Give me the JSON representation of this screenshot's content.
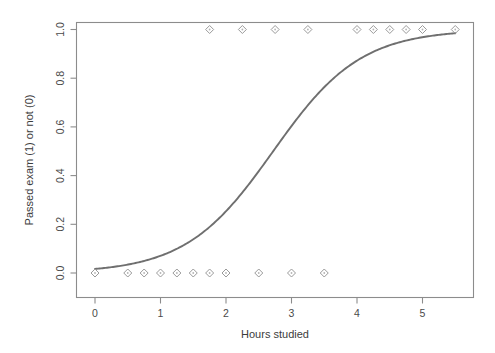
{
  "chart_data": {
    "type": "scatter",
    "title": "",
    "subtitle": "",
    "xlabel": "Hours studied",
    "ylabel": "Passed exam (1) or not (0)",
    "xlim": [
      -0.28,
      5.85
    ],
    "ylim": [
      -0.05,
      1.06
    ],
    "xticks": [
      0,
      1,
      2,
      3,
      4,
      5
    ],
    "xticklabels": [
      "0",
      "1",
      "2",
      "3",
      "4",
      "5"
    ],
    "yticks": [
      0.0,
      0.2,
      0.4,
      0.6,
      0.8,
      1.0
    ],
    "yticklabels": [
      "0.0",
      "0.2",
      "0.4",
      "0.6",
      "0.8",
      "1.0"
    ],
    "grid": false,
    "legend": "none",
    "marker_style": "open-diamond",
    "marker_color": "#9a9a9a",
    "curve_color": "#6f6f6f",
    "frame_color": "#8c8c8c",
    "background": "#ffffff",
    "series": [
      {
        "name": "Observations",
        "type": "scatter",
        "x": [
          0.0,
          0.5,
          0.75,
          1.0,
          1.25,
          1.5,
          1.75,
          1.75,
          2.0,
          2.25,
          2.5,
          2.75,
          3.0,
          3.25,
          3.5,
          4.0,
          4.25,
          4.5,
          4.75,
          5.0,
          5.5
        ],
        "y": [
          0,
          0,
          0,
          0,
          0,
          0,
          0,
          1,
          0,
          1,
          0,
          1,
          0,
          1,
          0,
          1,
          1,
          1,
          1,
          1,
          1
        ]
      },
      {
        "name": "Logistic fit",
        "type": "line",
        "model": "logistic",
        "midpoint_x": 2.72,
        "slope_k": 1.5,
        "x_range": [
          0,
          5.5
        ],
        "sample_points_x": [
          0.0,
          0.5,
          1.0,
          1.5,
          2.0,
          2.5,
          2.72,
          3.0,
          3.5,
          4.0,
          4.5,
          5.0,
          5.5
        ],
        "sample_points_y": [
          0.017,
          0.036,
          0.074,
          0.147,
          0.268,
          0.441,
          0.5,
          0.624,
          0.786,
          0.887,
          0.943,
          0.972,
          0.987
        ]
      }
    ]
  },
  "axes": {
    "x_title": "Hours studied",
    "y_title": "Passed exam (1) or not (0)"
  }
}
